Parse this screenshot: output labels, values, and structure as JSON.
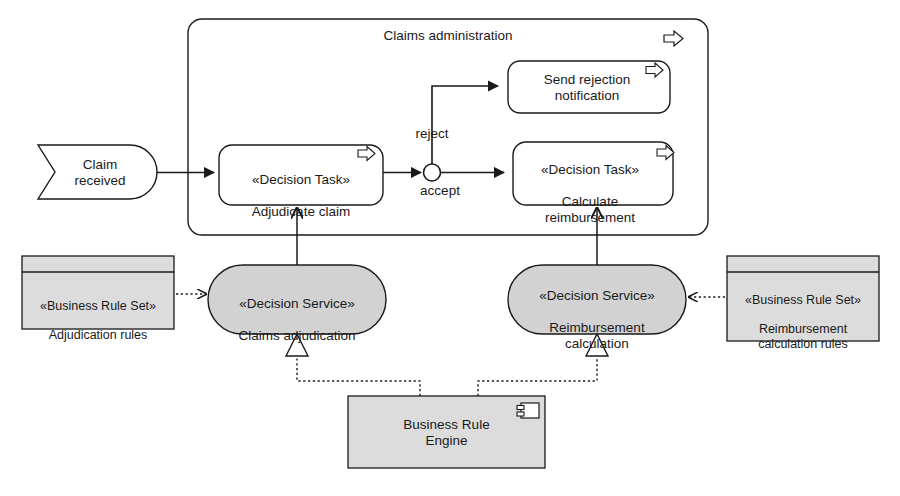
{
  "diagram": {
    "type": "uml-bpmn-business-rules-diagram",
    "colors": {
      "line": "#1a1a1a",
      "text": "#1a1a1a",
      "gray_fill": "#d2d2d2",
      "gray_fill_light": "#dcdcdc",
      "white_fill": "#ffffff"
    }
  },
  "pool": {
    "label": "Claims administration",
    "marker_icon": "process-arrow-icon"
  },
  "start_event": {
    "label": "Claim\nreceived",
    "shape": "message-event-pentagon"
  },
  "tasks": [
    {
      "id": "adjudicate",
      "stereotype": "«Decision Task»",
      "name": "Adjudicate claim",
      "marker_icon": "process-arrow-icon"
    },
    {
      "id": "send-rejection",
      "stereotype": "",
      "name": "Send rejection\nnotification",
      "marker_icon": "process-arrow-icon"
    },
    {
      "id": "calculate",
      "stereotype": "«Decision Task»",
      "name": "Calculate\nreimbursement",
      "marker_icon": "process-arrow-icon"
    }
  ],
  "gateway": {
    "shape": "decision-circle",
    "branches": [
      {
        "id": "reject",
        "label": "reject"
      },
      {
        "id": "accept",
        "label": "accept"
      }
    ]
  },
  "decision_services": [
    {
      "id": "claims-adjudication",
      "stereotype": "«Decision Service»",
      "name": "Claims adjudication"
    },
    {
      "id": "reimbursement-calculation",
      "stereotype": "«Decision Service»",
      "name": "Reimbursement\ncalculation"
    }
  ],
  "business_rule_sets": [
    {
      "id": "adjudication-rules",
      "stereotype": "«Business Rule Set»",
      "name": "Adjudication rules"
    },
    {
      "id": "reimbursement-calculation-rules",
      "stereotype": "«Business Rule Set»",
      "name": "Reimbursement\ncalculation rules"
    }
  ],
  "component": {
    "id": "business-rule-engine",
    "name": "Business Rule\nEngine",
    "icon": "component-icon"
  }
}
